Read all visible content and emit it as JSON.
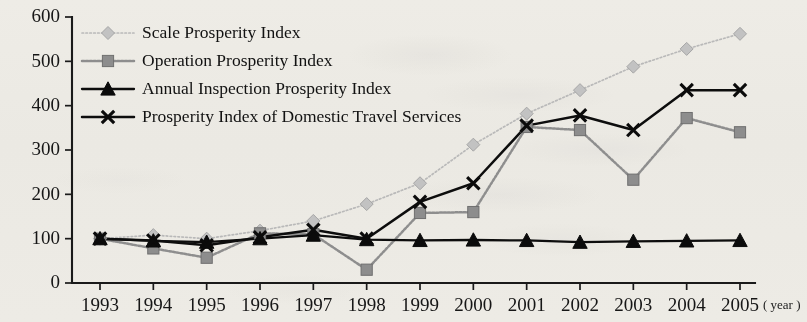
{
  "chart_data": {
    "type": "line",
    "title": "",
    "xlabel": "( year )",
    "ylabel": "",
    "x": [
      1993,
      1994,
      1995,
      1996,
      1997,
      1998,
      1999,
      2000,
      2001,
      2002,
      2003,
      2004,
      2005
    ],
    "categories": [
      "1993",
      "1994",
      "1995",
      "1996",
      "1997",
      "1998",
      "1999",
      "2000",
      "2001",
      "2002",
      "2003",
      "2004",
      "2005"
    ],
    "ylim": [
      0,
      600
    ],
    "yticks": [
      0,
      100,
      200,
      300,
      400,
      500,
      600
    ],
    "ytick_labels": [
      "0",
      "100",
      "200",
      "300",
      "400",
      "500",
      "600"
    ],
    "grid": false,
    "legend_position": "upper-left-inside",
    "series": [
      {
        "name": "Scale Prosperity Index",
        "marker": "diamond",
        "linestyle": "dotted",
        "color": "#c2c2c2",
        "values": [
          100,
          108,
          100,
          118,
          140,
          178,
          225,
          312,
          382,
          435,
          488,
          528,
          562
        ]
      },
      {
        "name": "Operation Prosperity Index",
        "marker": "square",
        "linestyle": "dashed",
        "color": "#8d8d8d",
        "values": [
          100,
          78,
          57,
          112,
          110,
          30,
          158,
          160,
          352,
          345,
          233,
          372,
          340
        ]
      },
      {
        "name": "Annual Inspection Prosperity Index",
        "marker": "triangle",
        "linestyle": "solid",
        "color": "#0b0b0b",
        "values": [
          100,
          95,
          92,
          100,
          108,
          98,
          96,
          97,
          96,
          92,
          94,
          95,
          96
        ]
      },
      {
        "name": "Prosperity Index of Domestic Travel Services",
        "marker": "x",
        "linestyle": "solid",
        "color": "#0b0b0b",
        "values": [
          100,
          96,
          85,
          103,
          120,
          100,
          183,
          225,
          355,
          378,
          345,
          435,
          435
        ]
      }
    ]
  },
  "legend": {
    "items": [
      {
        "label": "Scale Prosperity Index",
        "marker": "diamond-marker"
      },
      {
        "label": "Operation Prosperity Index",
        "marker": "square-marker"
      },
      {
        "label": "Annual Inspection Prosperity Index",
        "marker": "triangle-marker"
      },
      {
        "label": "Prosperity Index of Domestic Travel Services",
        "marker": "x-marker"
      }
    ]
  },
  "axes": {
    "y_ticks": [
      "600",
      "500",
      "400",
      "300",
      "200",
      "100",
      "0"
    ],
    "x_ticks": [
      "1993",
      "1994",
      "1995",
      "1996",
      "1997",
      "1998",
      "1999",
      "2000",
      "2001",
      "2002",
      "2003",
      "2004",
      "2005"
    ],
    "x_unit_label": "( year )"
  }
}
